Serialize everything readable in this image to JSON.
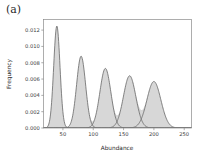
{
  "figure": {
    "panel_label": "(a)",
    "background_color": "#ffffff"
  },
  "colors": {
    "fill": "#d7d7d7",
    "line": "#6e6e6e",
    "spine": "#8a8a8a",
    "text": "#2b2b2b"
  },
  "axes": {
    "x": {
      "title": "Abundance",
      "ticks": [
        50,
        100,
        150,
        200,
        250
      ],
      "tick_labels": [
        "50",
        "100",
        "150",
        "200",
        "250"
      ],
      "range": [
        18,
        262
      ]
    },
    "y": {
      "title": "Frequency",
      "ticks": [
        0.0,
        0.002,
        0.004,
        0.006,
        0.008,
        0.01,
        0.012
      ],
      "tick_labels": [
        "0.000",
        "0.002",
        "0.004",
        "0.006",
        "0.008",
        "0.010",
        "0.012"
      ],
      "range": [
        0,
        0.0133
      ]
    }
  },
  "chart_data": {
    "type": "line",
    "title": "",
    "subtitle": "",
    "xlabel": "Abundance",
    "ylabel": "Frequency",
    "xlim": [
      18,
      262
    ],
    "ylim": [
      0,
      0.0133
    ],
    "grid": false,
    "legend": "none",
    "components": [
      {
        "name": "component-1",
        "mean": 40,
        "sigma": 5.2,
        "peak": 0.0125
      },
      {
        "name": "component-2",
        "mean": 80,
        "sigma": 7.4,
        "peak": 0.0088
      },
      {
        "name": "component-3",
        "mean": 120,
        "sigma": 9.0,
        "peak": 0.0073
      },
      {
        "name": "component-4",
        "mean": 160,
        "sigma": 10.2,
        "peak": 0.0064
      },
      {
        "name": "component-5",
        "mean": 200,
        "sigma": 11.5,
        "peak": 0.0057
      }
    ],
    "series": [
      {
        "name": "mixture-density",
        "x": [
          20,
          25,
          30,
          35,
          40,
          45,
          50,
          55,
          60,
          65,
          70,
          75,
          80,
          85,
          90,
          95,
          100,
          105,
          110,
          115,
          120,
          125,
          130,
          135,
          140,
          145,
          150,
          155,
          160,
          165,
          170,
          175,
          180,
          185,
          190,
          195,
          200,
          205,
          210,
          215,
          220,
          225,
          230,
          235,
          240,
          245,
          250,
          255,
          260
        ],
        "values": [
          0.0,
          0.0008,
          0.0048,
          0.0111,
          0.0125,
          0.0111,
          0.0048,
          0.0012,
          0.0009,
          0.0029,
          0.0063,
          0.0085,
          0.0088,
          0.0085,
          0.0063,
          0.0035,
          0.0028,
          0.0043,
          0.0062,
          0.0072,
          0.0073,
          0.0072,
          0.0062,
          0.0043,
          0.0032,
          0.0037,
          0.005,
          0.006,
          0.0064,
          0.006,
          0.005,
          0.0039,
          0.0037,
          0.0043,
          0.0052,
          0.0056,
          0.0057,
          0.0056,
          0.0052,
          0.0043,
          0.0032,
          0.0021,
          0.0012,
          0.0006,
          0.0003,
          0.0001,
          0.0,
          0.0,
          0.0
        ]
      }
    ]
  }
}
